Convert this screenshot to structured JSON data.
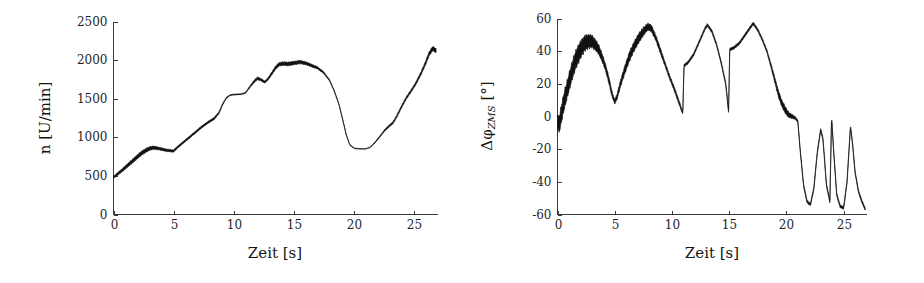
{
  "figure": {
    "name": "zwei-messdiagramme",
    "background_color": "#ffffff",
    "trace_color": "#111111",
    "axis_color": "#3a3a3a"
  },
  "panels": [
    {
      "id": "drehzahl",
      "x_axis_title": "Zeit [s]",
      "y_axis_title_plain": "n [U/min]",
      "y_axis_title_main": "n [U/min]",
      "x_ticks": [
        "0",
        "5",
        "10",
        "15",
        "20",
        "25"
      ],
      "y_ticks": [
        "0",
        "500",
        "1000",
        "1500",
        "2000",
        "2500"
      ]
    },
    {
      "id": "winkeldifferenz",
      "x_axis_title": "Zeit [s]",
      "y_axis_title_plain": "ΔφZMS [°]",
      "y_axis_title_prefix": "Δφ",
      "y_axis_title_sub": "ZMS",
      "y_axis_title_suffix": " [°]",
      "x_ticks": [
        "0",
        "5",
        "10",
        "15",
        "20",
        "25"
      ],
      "y_ticks": [
        "-60",
        "-40",
        "-20",
        "0",
        "20",
        "40",
        "60"
      ]
    }
  ],
  "chart_data": [
    {
      "type": "line",
      "id": "drehzahl",
      "title": "",
      "xlabel": "Zeit [s]",
      "ylabel": "n [U/min]",
      "xlim": [
        0,
        27
      ],
      "ylim": [
        0,
        2500
      ],
      "xticks": [
        0,
        5,
        10,
        15,
        20,
        25
      ],
      "yticks": [
        0,
        500,
        1000,
        1500,
        2000,
        2500
      ],
      "grid": false,
      "legend": "none",
      "series": [
        {
          "name": "n",
          "note": "Motordrehzahl mit ueberlagerter hochfrequenter Schwingung (Bandbreite)",
          "x": [
            0.0,
            0.3,
            0.7,
            1.1,
            1.5,
            1.9,
            2.3,
            2.7,
            3.0,
            3.3,
            3.6,
            3.9,
            4.2,
            4.5,
            4.8,
            5.0,
            5.4,
            5.9,
            6.4,
            6.9,
            7.4,
            7.9,
            8.1,
            8.4,
            8.8,
            9.1,
            9.4,
            9.7,
            10.1,
            10.6,
            11.0,
            11.3,
            11.7,
            12.0,
            12.3,
            12.6,
            12.9,
            13.2,
            13.5,
            13.8,
            14.1,
            14.5,
            15.0,
            15.5,
            16.0,
            16.5,
            17.0,
            17.5,
            18.0,
            18.4,
            18.8,
            19.1,
            19.4,
            19.7,
            20.1,
            20.6,
            21.0,
            21.4,
            21.8,
            22.2,
            22.6,
            23.0,
            23.3,
            23.6,
            24.0,
            24.4,
            24.8,
            25.2,
            25.6,
            26.0,
            26.3,
            26.6,
            26.9
          ],
          "y_center": [
            480,
            520,
            570,
            625,
            680,
            735,
            790,
            830,
            855,
            865,
            860,
            850,
            840,
            830,
            825,
            822,
            880,
            945,
            1010,
            1075,
            1140,
            1195,
            1215,
            1245,
            1320,
            1430,
            1510,
            1545,
            1555,
            1558,
            1575,
            1640,
            1720,
            1765,
            1745,
            1715,
            1760,
            1830,
            1900,
            1945,
            1955,
            1950,
            1960,
            1975,
            1960,
            1930,
            1900,
            1840,
            1740,
            1600,
            1420,
            1230,
            1030,
            900,
            855,
            850,
            850,
            870,
            935,
            1010,
            1090,
            1150,
            1190,
            1270,
            1395,
            1510,
            1600,
            1700,
            1820,
            1960,
            2080,
            2150,
            2120
          ],
          "band": [
            35,
            42,
            48,
            55,
            60,
            64,
            66,
            64,
            60,
            54,
            48,
            44,
            42,
            40,
            38,
            36,
            34,
            34,
            34,
            34,
            34,
            34,
            36,
            36,
            30,
            24,
            20,
            16,
            14,
            14,
            16,
            26,
            38,
            44,
            40,
            34,
            38,
            46,
            52,
            56,
            58,
            58,
            56,
            54,
            50,
            44,
            38,
            30,
            22,
            16,
            14,
            14,
            14,
            12,
            10,
            8,
            8,
            10,
            16,
            22,
            28,
            32,
            34,
            36,
            38,
            38,
            40,
            44,
            50,
            58,
            66,
            70,
            68
          ],
          "units": "U/min"
        }
      ]
    },
    {
      "type": "line",
      "id": "winkeldifferenz",
      "title": "",
      "xlabel": "Zeit [s]",
      "ylabel": "ΔφZMS [°]",
      "xlim": [
        0,
        27
      ],
      "ylim": [
        -60,
        60
      ],
      "xticks": [
        0,
        5,
        10,
        15,
        20,
        25
      ],
      "yticks": [
        -60,
        -40,
        -20,
        0,
        20,
        40,
        60
      ],
      "grid": false,
      "legend": "none",
      "series": [
        {
          "name": "ΔφZMS",
          "note": "Verdrehwinkel Zweimassenschwungrad mit Schwingungsband",
          "x": [
            0.0,
            0.15,
            0.35,
            0.6,
            0.9,
            1.2,
            1.5,
            1.8,
            2.1,
            2.4,
            2.7,
            3.0,
            3.3,
            3.6,
            3.9,
            4.2,
            4.5,
            4.75,
            5.0,
            5.2,
            5.5,
            5.9,
            6.3,
            6.7,
            7.1,
            7.5,
            7.9,
            8.2,
            8.6,
            9.0,
            9.4,
            9.8,
            10.2,
            10.6,
            10.95,
            11.05,
            11.4,
            11.9,
            12.4,
            12.9,
            13.1,
            13.5,
            13.9,
            14.3,
            14.7,
            14.95,
            15.05,
            15.4,
            15.9,
            16.4,
            16.9,
            17.1,
            17.5,
            17.9,
            18.3,
            18.7,
            19.0,
            19.3,
            19.6,
            19.9,
            20.2,
            20.5,
            20.8,
            21.0,
            21.2,
            21.5,
            21.8,
            22.1,
            22.4,
            22.7,
            23.0,
            23.2,
            23.5,
            23.8,
            23.95,
            24.1,
            24.4,
            24.7,
            25.0,
            25.3,
            25.6,
            25.8,
            26.0,
            26.3,
            26.6,
            26.9
          ],
          "y_center": [
            -3,
            -5,
            2,
            10,
            18,
            26,
            33,
            38,
            42,
            45,
            46,
            46,
            44,
            41,
            36,
            30,
            22,
            14,
            9,
            12,
            20,
            29,
            37,
            43,
            48,
            52,
            55,
            54,
            48,
            40,
            32,
            24,
            17,
            9,
            2,
            31,
            33,
            38,
            46,
            54,
            56,
            52,
            44,
            33,
            20,
            3,
            41,
            42,
            45,
            50,
            55,
            57,
            53,
            47,
            40,
            30,
            22,
            14,
            8,
            4,
            1,
            0,
            -1,
            -3,
            -20,
            -42,
            -52,
            -54,
            -44,
            -22,
            -8,
            -14,
            -42,
            -52,
            0,
            -18,
            -48,
            -55,
            -56,
            -40,
            -6,
            -18,
            -34,
            -46,
            -52,
            -57
          ],
          "band": [
            10,
            12,
            13,
            13,
            13,
            13,
            13,
            13,
            12,
            11,
            10,
            9,
            8,
            7,
            6,
            5,
            5,
            4,
            3,
            4,
            5,
            6,
            7,
            7,
            7,
            6,
            5,
            5,
            4,
            4,
            3,
            3,
            3,
            3,
            2,
            2,
            2,
            2,
            2,
            2,
            2,
            2,
            2,
            2,
            2,
            2,
            2,
            2,
            2,
            2,
            2,
            2,
            2,
            2,
            2,
            3,
            4,
            5,
            5,
            5,
            4,
            3,
            2,
            2,
            2,
            2,
            2,
            2,
            2,
            2,
            2,
            2,
            2,
            2,
            2,
            2,
            2,
            2,
            2,
            2,
            2,
            2,
            2,
            2,
            2,
            2
          ],
          "units": "°"
        }
      ]
    }
  ]
}
